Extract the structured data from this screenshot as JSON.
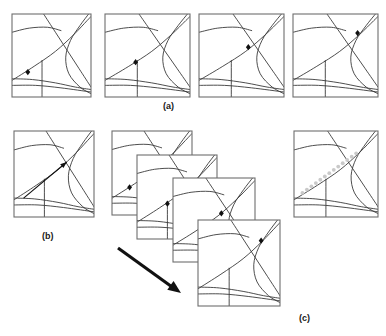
{
  "figure": {
    "title": "",
    "background": "#ffffff",
    "stroke_color": "#3a3a3a",
    "panel_border_color": "#6e6e6e",
    "marker_color": "#111111",
    "trail_color": "#c9c9c9",
    "arrow_color": "#111111",
    "width": 386,
    "height": 336
  },
  "captions": [
    {
      "id": "caption-a",
      "label": "(a)",
      "x": 163,
      "y": 101
    },
    {
      "id": "caption-b",
      "label": "(b)",
      "x": 42,
      "y": 231
    },
    {
      "id": "caption-c",
      "label": "(c)",
      "x": 299,
      "y": 313
    }
  ],
  "panels": {
    "row_a": [
      {
        "id": "panel-a1",
        "x": 12,
        "y": 14,
        "w": 79,
        "h": 83,
        "marker": {
          "x": 0.2,
          "y": 0.7
        },
        "has_marker": true
      },
      {
        "id": "panel-a2",
        "x": 105,
        "y": 14,
        "w": 85,
        "h": 83,
        "marker": {
          "x": 0.36,
          "y": 0.58
        },
        "has_marker": true
      },
      {
        "id": "panel-a3",
        "x": 199,
        "y": 14,
        "w": 85,
        "h": 83,
        "marker": {
          "x": 0.58,
          "y": 0.4
        },
        "has_marker": true
      },
      {
        "id": "panel-a4",
        "x": 293,
        "y": 14,
        "w": 85,
        "h": 83,
        "marker": {
          "x": 0.76,
          "y": 0.23
        },
        "has_marker": true
      }
    ],
    "panel_b": {
      "id": "panel-b",
      "x": 14,
      "y": 131,
      "w": 80,
      "h": 86,
      "arrow": {
        "x1": 0.12,
        "y1": 0.78,
        "x2": 0.66,
        "y2": 0.36
      }
    },
    "cascade": [
      {
        "id": "cascade-1",
        "x": 112,
        "y": 131,
        "w": 80,
        "h": 84,
        "marker": {
          "x": 0.22,
          "y": 0.67
        },
        "has_marker": true
      },
      {
        "id": "cascade-2",
        "x": 137,
        "y": 155,
        "w": 80,
        "h": 84,
        "marker": {
          "x": 0.38,
          "y": 0.58
        },
        "has_marker": true
      },
      {
        "id": "cascade-3",
        "x": 173,
        "y": 178,
        "w": 82,
        "h": 84,
        "marker": {
          "x": 0.59,
          "y": 0.42
        },
        "has_marker": true
      },
      {
        "id": "cascade-4",
        "x": 198,
        "y": 220,
        "w": 82,
        "h": 86,
        "marker": {
          "x": 0.77,
          "y": 0.24
        },
        "has_marker": true
      }
    ],
    "panel_c_result": {
      "id": "panel-c-result",
      "x": 294,
      "y": 131,
      "w": 84,
      "h": 86,
      "marker": {
        "x": 0.77,
        "y": 0.22
      },
      "trail": {
        "x1": 0.1,
        "y1": 0.72,
        "x2": 0.74,
        "y2": 0.26,
        "dots": 13
      }
    }
  },
  "cascade_arrow": {
    "id": "cascade-arrow",
    "x1": 118,
    "y1": 248,
    "x2": 181,
    "y2": 293
  },
  "scene_lines": {
    "description": "normalized 0..1 polylines drawn inside every panel",
    "paths": [
      {
        "name": "upper-left-ridge",
        "points": [
          [
            0.0,
            0.22
          ],
          [
            0.22,
            0.17
          ],
          [
            0.45,
            0.16
          ],
          [
            0.62,
            0.2
          ]
        ]
      },
      {
        "name": "main-diagonal-rising",
        "points": [
          [
            0.0,
            0.8
          ],
          [
            0.28,
            0.63
          ],
          [
            0.55,
            0.45
          ],
          [
            0.78,
            0.25
          ],
          [
            0.95,
            0.08
          ],
          [
            1.0,
            0.03
          ]
        ]
      },
      {
        "name": "descending-diagonal",
        "points": [
          [
            0.4,
            0.0
          ],
          [
            0.55,
            0.22
          ],
          [
            0.7,
            0.44
          ],
          [
            0.85,
            0.66
          ],
          [
            1.0,
            0.88
          ]
        ]
      },
      {
        "name": "right-curve",
        "points": [
          [
            0.97,
            0.0
          ],
          [
            0.86,
            0.14
          ],
          [
            0.74,
            0.32
          ],
          [
            0.68,
            0.52
          ],
          [
            0.72,
            0.72
          ],
          [
            0.86,
            0.88
          ],
          [
            1.0,
            0.96
          ]
        ]
      },
      {
        "name": "lower-horizon",
        "points": [
          [
            0.0,
            0.78
          ],
          [
            0.26,
            0.79
          ],
          [
            0.55,
            0.83
          ],
          [
            0.8,
            0.88
          ],
          [
            1.0,
            0.91
          ]
        ]
      },
      {
        "name": "vertical-post",
        "points": [
          [
            0.38,
            0.56
          ],
          [
            0.38,
            1.0
          ]
        ]
      },
      {
        "name": "lower-band",
        "points": [
          [
            0.0,
            0.86
          ],
          [
            0.3,
            0.86
          ],
          [
            0.62,
            0.89
          ],
          [
            1.0,
            0.94
          ]
        ]
      }
    ]
  }
}
